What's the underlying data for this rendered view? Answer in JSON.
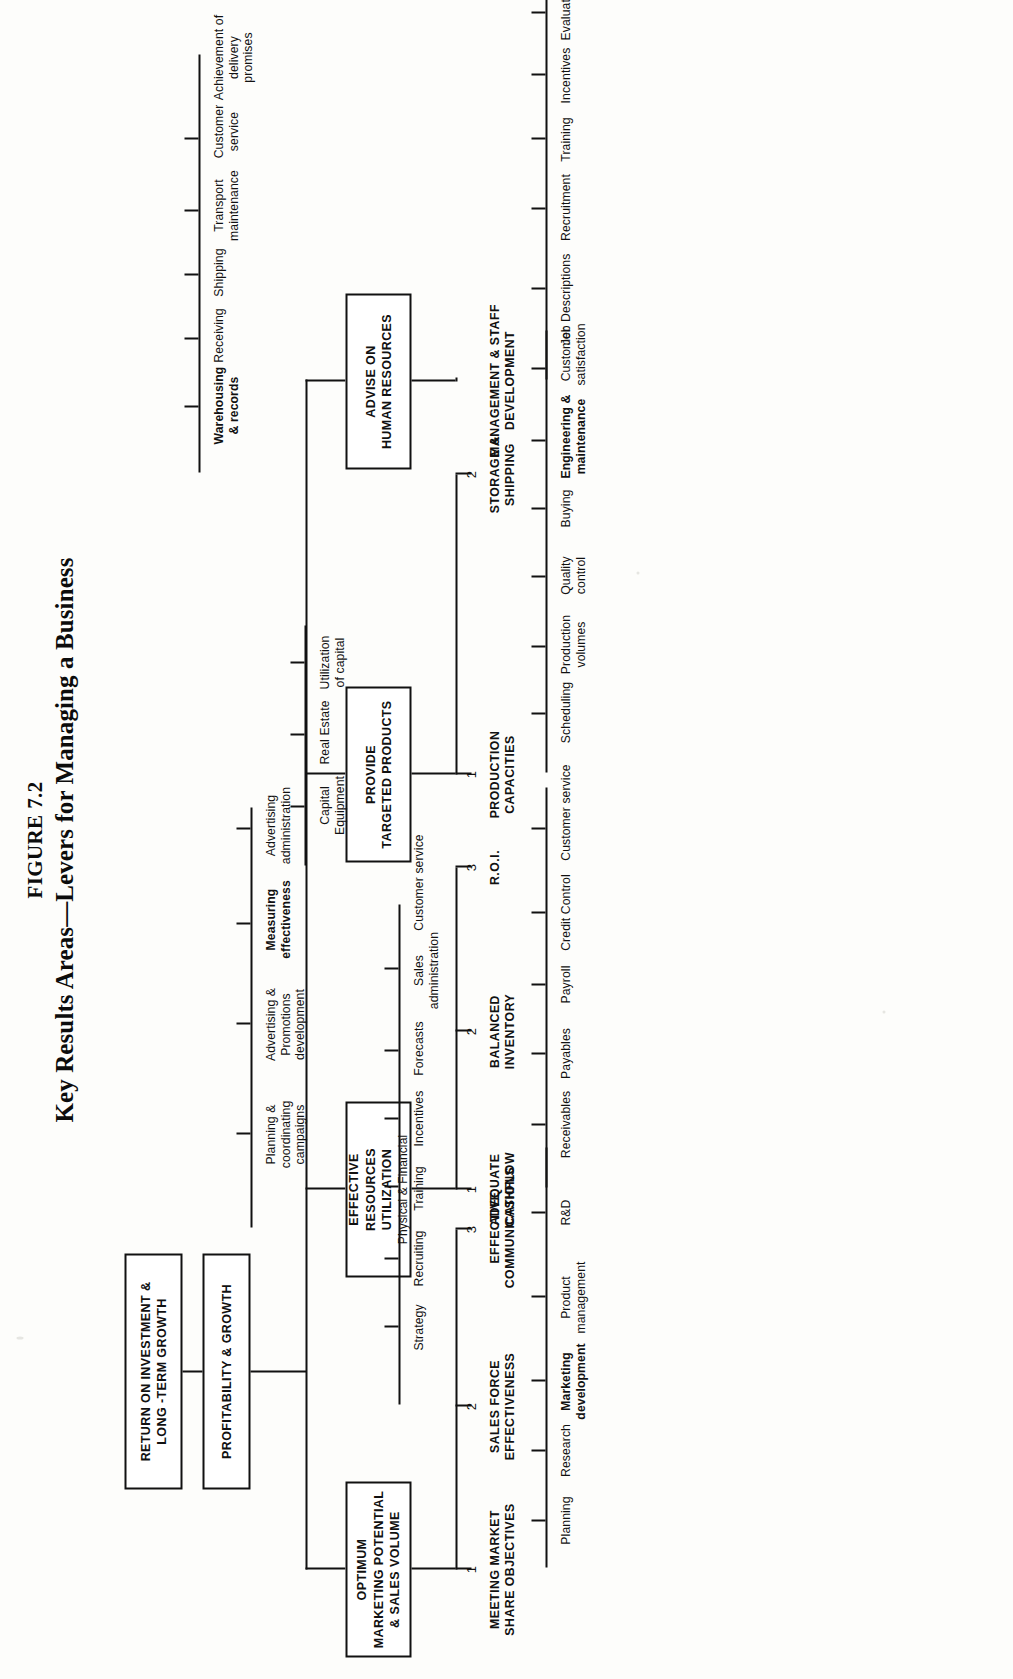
{
  "figure": {
    "number": "FIGURE 7.2",
    "title": "Key Results Areas—Levers for Managing a Business"
  },
  "root": {
    "label_line1": "PROFITABILITY & GROWTH"
  },
  "top_box": {
    "label_line1": "RETURN ON INVESTMENT &",
    "label_line2": "LONG -TERM GROWTH"
  },
  "pillars": [
    {
      "id": "marketing",
      "label_line1": "OPTIMUM",
      "label_line2": "MARKETING POTENTIAL",
      "label_line3": "& SALES VOLUME",
      "branches": [
        {
          "index": "1",
          "title_line1": "MEETING",
          "title_line2": "MARKET SHARE",
          "title_line3": "OBJECTIVES",
          "leaves": [
            {
              "text": "Planning",
              "bold": false
            },
            {
              "text": "Research",
              "bold": false
            },
            {
              "text": "Marketing\ndevelopment",
              "bold": true
            },
            {
              "text": "Product\nmanagement",
              "bold": false
            },
            {
              "text": "R&D",
              "bold": false
            }
          ]
        },
        {
          "index": "2",
          "title_line1": "SALES",
          "title_line2": "FORCE",
          "title_line3": "EFFECTIVENESS",
          "leaves": [
            {
              "text": "Strategy",
              "bold": false
            },
            {
              "text": "Recruiting",
              "bold": false
            },
            {
              "text": "Training",
              "bold": false
            },
            {
              "text": "Incentives",
              "bold": false
            },
            {
              "text": "Forecasts",
              "bold": false
            },
            {
              "text": "Sales\nadministration",
              "bold": false
            },
            {
              "text": "Customer service",
              "bold": false
            }
          ]
        },
        {
          "index": "3",
          "title_line1": "EFFECTIVE",
          "title_line2": "COMMUNICATIONS",
          "title_line3": "",
          "leaves": [
            {
              "text": "Planning &\ncoordinating\ncampaigns",
              "bold": false
            },
            {
              "text": "Advertising &\nPromotions\ndevelopment",
              "bold": false
            },
            {
              "text": "Measuring\neffectiveness",
              "bold": true
            },
            {
              "text": "Advertising\nadministration",
              "bold": false
            }
          ]
        }
      ]
    },
    {
      "id": "resources",
      "label_line1": "EFFECTIVE",
      "label_line2": "RESOURCES UTILIZATION",
      "label_line3": "Physical & Financial",
      "branches": [
        {
          "index": "1",
          "title_line1": "ADEQUATE",
          "title_line2": "CASHFLOW",
          "title_line3": "",
          "leaves": [
            {
              "text": "Receivables",
              "bold": false
            },
            {
              "text": "Payables",
              "bold": false
            },
            {
              "text": "Payroll",
              "bold": false
            },
            {
              "text": "Credit Control",
              "bold": false
            },
            {
              "text": "Customer service",
              "bold": false
            }
          ]
        },
        {
          "index": "2",
          "title_line1": "BALANCED",
          "title_line2": "INVENTORY",
          "title_line3": "",
          "leaves": []
        },
        {
          "index": "3",
          "title_line1": "R.O.I.",
          "title_line2": "",
          "title_line3": "",
          "leaves": [
            {
              "text": "Capital\nEquipment",
              "bold": false
            },
            {
              "text": "Real Estate",
              "bold": false
            },
            {
              "text": "Utilization\nof capital",
              "bold": false
            }
          ]
        }
      ]
    },
    {
      "id": "products",
      "label_line1": "PROVIDE",
      "label_line2": "TARGETED PRODUCTS",
      "label_line3": "",
      "branches": [
        {
          "index": "1",
          "title_line1": "PRODUCTION",
          "title_line2": "CAPACITIES",
          "title_line3": "",
          "leaves": [
            {
              "text": "Scheduling",
              "bold": false
            },
            {
              "text": "Production\nvolumes",
              "bold": false
            },
            {
              "text": "Quality\ncontrol",
              "bold": false
            },
            {
              "text": "Buying",
              "bold": false
            },
            {
              "text": "Engineering &\nmaintenance",
              "bold": true
            },
            {
              "text": "Customer\nsatisfaction",
              "bold": false
            }
          ]
        },
        {
          "index": "2",
          "title_line1": "STORAGE",
          "title_line2": "&",
          "title_line3": "SHIPPING",
          "leaves": [
            {
              "text": "Warehousing\n& records",
              "bold": true
            },
            {
              "text": "Receiving",
              "bold": false
            },
            {
              "text": "Shipping",
              "bold": false
            },
            {
              "text": "Transport\nmaintenance",
              "bold": false
            },
            {
              "text": "Customer\nservice",
              "bold": false
            },
            {
              "text": "Achievement of\ndelivery\npromises",
              "bold": false
            }
          ]
        }
      ]
    },
    {
      "id": "hr",
      "label_line1": "ADVISE ON",
      "label_line2": "HUMAN RESOURCES",
      "label_line3": "",
      "branches": [
        {
          "index": "",
          "title_line1": "MANAGEMENT & STAFF",
          "title_line2": "DEVELOPMENT",
          "title_line3": "",
          "leaves": [
            {
              "text": "Job Descriptions",
              "bold": false
            },
            {
              "text": "Recruitment",
              "bold": false
            },
            {
              "text": "Training",
              "bold": false
            },
            {
              "text": "Incentives",
              "bold": false
            },
            {
              "text": "Evaluation",
              "bold": false
            },
            {
              "text": "Internal P.R.",
              "bold": false
            }
          ]
        }
      ]
    }
  ]
}
